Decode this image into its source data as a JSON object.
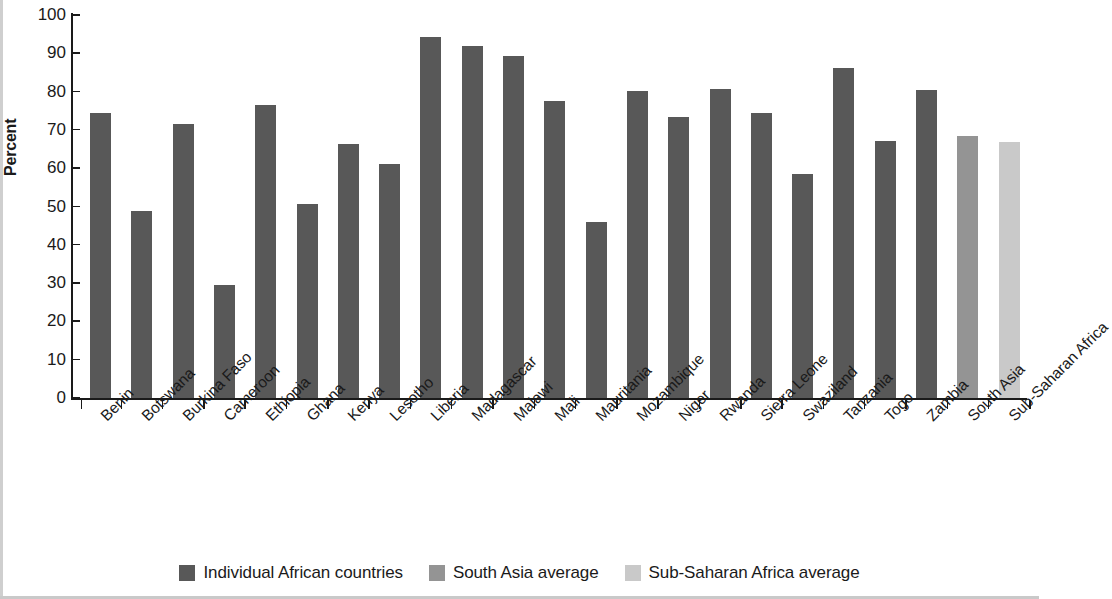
{
  "chart_data": {
    "type": "bar",
    "title": "",
    "xlabel": "",
    "ylabel": "Percent",
    "ylim": [
      0,
      100
    ],
    "yticks": [
      0,
      10,
      20,
      30,
      40,
      50,
      60,
      70,
      80,
      90,
      100
    ],
    "grid": false,
    "legend_position": "bottom-center",
    "categories": [
      "Benin",
      "Botswana",
      "Burkina Faso",
      "Cameroon",
      "Ethiopia",
      "Ghana",
      "Kenya",
      "Lesotho",
      "Liberia",
      "Madagascar",
      "Malawi",
      "Mali",
      "Mauritania",
      "Mozambique",
      "Niger",
      "Rwanda",
      "Sierra Leone",
      "Swaziland",
      "Tanzania",
      "Togo",
      "Zambia",
      "South Asia",
      "Sub-Saharan Africa"
    ],
    "values": [
      74.5,
      48.8,
      71.6,
      29.4,
      76.6,
      50.7,
      66.2,
      61.2,
      94.2,
      92.0,
      89.3,
      77.5,
      46.0,
      80.2,
      73.5,
      80.8,
      74.3,
      58.6,
      86.2,
      67.1,
      80.5,
      68.4,
      66.8
    ],
    "series_of": [
      "Individual African countries",
      "Individual African countries",
      "Individual African countries",
      "Individual African countries",
      "Individual African countries",
      "Individual African countries",
      "Individual African countries",
      "Individual African countries",
      "Individual African countries",
      "Individual African countries",
      "Individual African countries",
      "Individual African countries",
      "Individual African countries",
      "Individual African countries",
      "Individual African countries",
      "Individual African countries",
      "Individual African countries",
      "Individual African countries",
      "Individual African countries",
      "Individual African countries",
      "Individual African countries",
      "South Asia average",
      "Sub-Saharan Africa average"
    ],
    "legend": [
      {
        "label": "Individual African countries",
        "color": "#585858"
      },
      {
        "label": "South Asia average",
        "color": "#949494"
      },
      {
        "label": "Sub-Saharan Africa average",
        "color": "#c9c9c9"
      }
    ],
    "colors": {
      "individual": "#585858",
      "south_asia": "#949494",
      "sub_saharan": "#c9c9c9",
      "axis": "#1a1a1a",
      "background": "#ffffff"
    }
  }
}
